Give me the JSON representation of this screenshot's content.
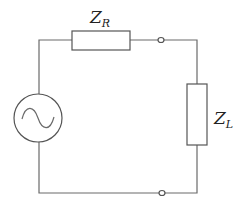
{
  "diagram": {
    "type": "circuit",
    "components": [
      {
        "id": "source",
        "kind": "ac-voltage-source",
        "symbol": "~"
      },
      {
        "id": "ZR",
        "kind": "impedance",
        "label_main": "Z",
        "label_sub": "R"
      },
      {
        "id": "ZL",
        "kind": "impedance",
        "label_main": "Z",
        "label_sub": "L"
      }
    ],
    "terminals": [
      {
        "id": "terminal-top",
        "position": "top wire between ZR and ZL"
      },
      {
        "id": "terminal-bottom",
        "position": "bottom wire"
      }
    ],
    "colors": {
      "line": "#6a6a6a",
      "background": "#ffffff"
    }
  }
}
